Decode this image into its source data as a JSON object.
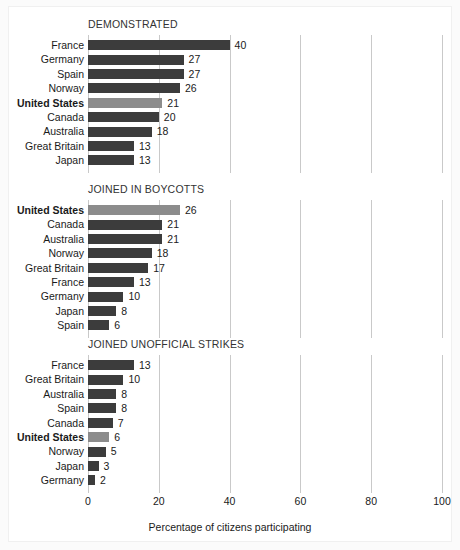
{
  "chart_data": {
    "type": "bar",
    "orientation": "horizontal",
    "title": "",
    "xlabel": "Percentage of citizens participating",
    "ylabel": "",
    "xlim": [
      0,
      100
    ],
    "xticks": [
      0,
      20,
      40,
      60,
      80,
      100
    ],
    "xticklabels": [
      "0",
      "20",
      "40",
      "60",
      "80",
      "100"
    ],
    "grid": "vertical",
    "legend": "none",
    "highlight_category": "United States",
    "colors": {
      "bar": "#3c3c3c",
      "bar_highlight": "#8c8c8c",
      "gridline": "#c9c9c9",
      "text": "#1a1a1a",
      "panel_title": "#333333",
      "background": "#ffffff",
      "figure_background": "#fbfbfb"
    },
    "panels": [
      {
        "title": "DEMONSTRATED",
        "categories": [
          "France",
          "Germany",
          "Spain",
          "Norway",
          "United States",
          "Canada",
          "Australia",
          "Great Britain",
          "Japan"
        ],
        "values": [
          40,
          27,
          27,
          26,
          21,
          20,
          18,
          13,
          13
        ]
      },
      {
        "title": "JOINED IN BOYCOTTS",
        "categories": [
          "United States",
          "Canada",
          "Australia",
          "Norway",
          "Great Britain",
          "France",
          "Germany",
          "Japan",
          "Spain"
        ],
        "values": [
          26,
          21,
          21,
          18,
          17,
          13,
          10,
          8,
          6
        ]
      },
      {
        "title": "JOINED UNOFFICIAL STRIKES",
        "categories": [
          "France",
          "Great Britain",
          "Australia",
          "Spain",
          "Canada",
          "United States",
          "Norway",
          "Japan",
          "Germany"
        ],
        "values": [
          13,
          10,
          8,
          8,
          7,
          6,
          5,
          3,
          2
        ]
      }
    ]
  }
}
